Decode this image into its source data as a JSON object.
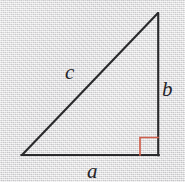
{
  "figure": {
    "type": "right-triangle-diagram",
    "canvas": {
      "width": 185,
      "height": 182
    },
    "background_color": "#e3e2e3",
    "stroke_color": "#2a2a2c",
    "stroke_width": 2,
    "right_angle_color": "#d0604e",
    "label_color": "#242428",
    "vertices": {
      "apex": {
        "x": 158,
        "y": 13
      },
      "bottom_left": {
        "x": 22,
        "y": 155
      },
      "bottom_right": {
        "x": 158,
        "y": 155
      }
    },
    "right_angle_marker": {
      "at_vertex": "bottom_right",
      "size": 18,
      "x": 140,
      "y": 137,
      "stroke_width": 1.6
    },
    "labels": {
      "hypotenuse": "c",
      "vertical_leg": "b",
      "horizontal_leg": "a"
    }
  }
}
